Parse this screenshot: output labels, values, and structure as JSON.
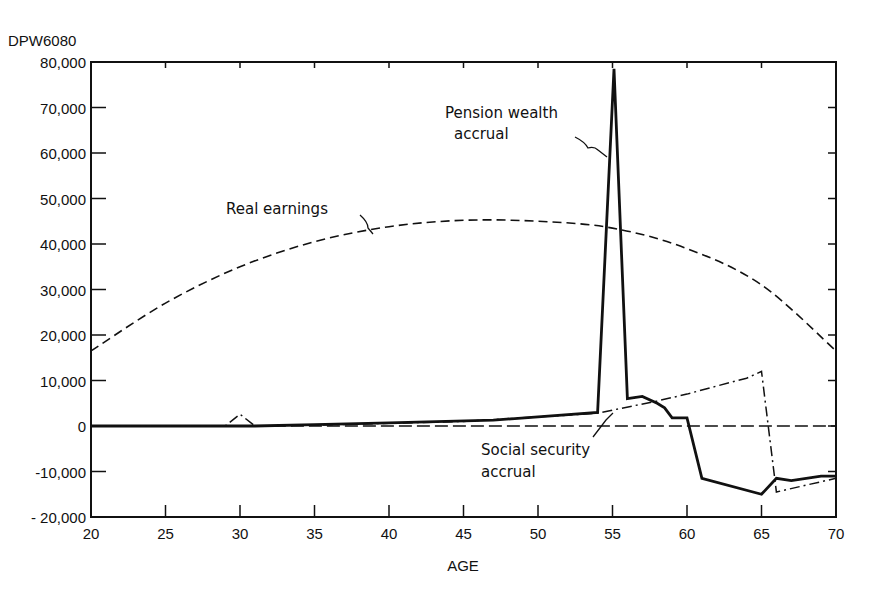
{
  "chart_data": {
    "type": "line",
    "title": "",
    "figure_id": "DPW6080",
    "xlabel": "AGE",
    "ylabel": "",
    "xlim": [
      20,
      70
    ],
    "ylim": [
      -20000,
      80000
    ],
    "x_ticks": [
      20,
      25,
      30,
      35,
      40,
      45,
      50,
      55,
      60,
      65,
      70
    ],
    "y_ticks": [
      80000,
      70000,
      60000,
      50000,
      40000,
      30000,
      20000,
      10000,
      0,
      -10000,
      -20000
    ],
    "y_tick_labels": [
      "80,000",
      "70,000",
      "60,000",
      "50,000",
      "40,000",
      "30,000",
      "20,000",
      "10,000",
      "0",
      "-10,000",
      "- 20,000"
    ],
    "x_tick_labels": [
      "20",
      "25",
      "30",
      "35",
      "40",
      "45",
      "50",
      "55",
      "60",
      "65",
      "70"
    ],
    "grid": false,
    "legend": "none (inline annotations)",
    "series": [
      {
        "name": "Real earnings",
        "style": "dashed",
        "x": [
          20,
          25,
          30,
          35,
          40,
          45,
          50,
          55,
          60,
          65,
          70
        ],
        "values": [
          16500,
          27000,
          35000,
          40500,
          43800,
          45200,
          45000,
          43500,
          39000,
          31000,
          16500
        ]
      },
      {
        "name": "Pension wealth accrual",
        "style": "solid-thick",
        "x": [
          20,
          29,
          31,
          35,
          40,
          47,
          50,
          54,
          55.1,
          56,
          57,
          58,
          58.5,
          59,
          60,
          61,
          65,
          66,
          67,
          69,
          70
        ],
        "values": [
          0,
          0,
          0,
          300,
          700,
          1300,
          2000,
          3000,
          78500,
          6000,
          6500,
          5000,
          4000,
          1800,
          1800,
          -11500,
          -15000,
          -11500,
          -12000,
          -11000,
          -11000
        ]
      },
      {
        "name": "Social security accrual",
        "style": "dash-dot",
        "x": [
          20,
          29,
          30,
          31,
          35,
          40,
          45,
          50,
          54,
          55,
          58,
          60,
          62,
          64,
          65,
          66,
          68,
          70
        ],
        "values": [
          0,
          0,
          2600,
          0,
          200,
          600,
          1000,
          2000,
          2800,
          3500,
          5500,
          7000,
          8800,
          10500,
          12000,
          -14500,
          -13000,
          -11500
        ]
      },
      {
        "name": "Zero baseline",
        "style": "long-dashed",
        "x": [
          31,
          70
        ],
        "values": [
          0,
          0
        ]
      }
    ],
    "annotations": [
      {
        "text": "Real earnings",
        "points_to": "Real earnings curve near age 38"
      },
      {
        "text": "Pension wealth accrual",
        "points_to": "Pension spike at age 55"
      },
      {
        "text": "Social security accrual",
        "points_to": "Social security curve near age 55"
      }
    ]
  },
  "labels": {
    "figure_id": "DPW6080",
    "xlabel": "AGE",
    "real_earnings": "Real earnings",
    "pension_line1": "Pension wealth",
    "pension_line2": "accrual",
    "ss_line1": "Social security",
    "ss_line2": "accrual"
  }
}
